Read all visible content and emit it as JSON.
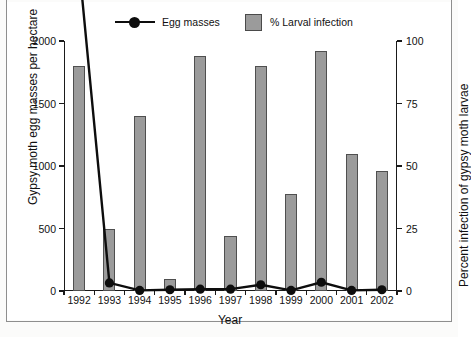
{
  "chart_data": {
    "type": "bar",
    "title": "",
    "subtitle": "",
    "xlabel": "Year",
    "ylabel": "Gypsy moth egg masses per hectare",
    "y2label": "Percent infection of gypsy moth larvae",
    "categories": [
      "1992",
      "1993",
      "1994",
      "1995",
      "1996",
      "1997",
      "1998",
      "1999",
      "2000",
      "2001",
      "2002"
    ],
    "ylim": [
      0,
      2000
    ],
    "y2lim": [
      0,
      100
    ],
    "yticks": [
      0,
      500,
      1000,
      1500,
      2000
    ],
    "y2ticks": [
      0,
      25,
      50,
      75,
      100
    ],
    "grid": false,
    "legend_position": "top",
    "series": [
      {
        "name": "% Larval infection",
        "type": "bar",
        "axis": "right",
        "color": "#9b9b9b",
        "edgecolor": "#4f4f4f",
        "values": [
          90,
          25,
          70,
          5,
          94,
          22,
          90,
          39,
          96,
          55,
          48
        ]
      },
      {
        "name": "Egg masses",
        "type": "line",
        "axis": "left",
        "color": "#0d0d0d",
        "marker": "circle",
        "values": [
          2600,
          65,
          5,
          10,
          15,
          15,
          50,
          5,
          70,
          5,
          10
        ],
        "note_first_point_offscale": "1992 value exceeds the 2000 axis maximum; the line is clipped at the plot top"
      }
    ]
  },
  "legend": {
    "items": [
      {
        "label": "Egg masses",
        "marker": "line-with-circle"
      },
      {
        "label": "% Larval infection",
        "marker": "filled-square"
      }
    ]
  },
  "axes": {
    "left": {
      "title": "Gypsy moth egg masses per hectare",
      "ticks": [
        "0",
        "500",
        "1000",
        "1500",
        "2000"
      ]
    },
    "right": {
      "title": "Percent infection of gypsy moth larvae",
      "ticks": [
        "0",
        "25",
        "50",
        "75",
        "100"
      ]
    },
    "bottom": {
      "title": "Year",
      "ticks": [
        "1992",
        "1993",
        "1994",
        "1995",
        "1996",
        "1997",
        "1998",
        "1999",
        "2000",
        "2001",
        "2002"
      ]
    }
  },
  "page": {
    "caption_faint": ""
  }
}
